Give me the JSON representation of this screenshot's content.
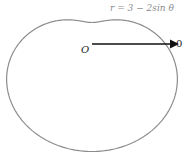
{
  "diagram": {
    "equation": "r = 3 − 2sin θ",
    "origin_label": "O",
    "polar_axis_label": "0",
    "curve_color": "#8c8c8c",
    "axis_color": "#111111"
  },
  "geometry": {
    "origin": [
      92,
      44
    ],
    "scale_x": 24.5,
    "scale_y": 21.5
  }
}
